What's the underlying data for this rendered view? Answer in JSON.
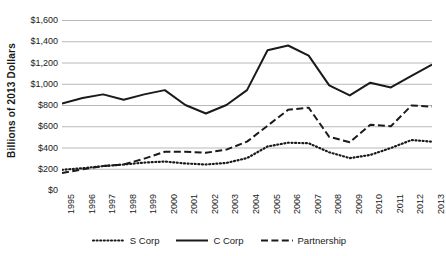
{
  "chart_data": {
    "type": "line",
    "title": "",
    "xlabel": "",
    "ylabel": "Billions of 2013 Dollars",
    "x": [
      1995,
      1996,
      1997,
      1998,
      1999,
      2000,
      2001,
      2002,
      2003,
      2004,
      2005,
      2006,
      2007,
      2008,
      2009,
      2010,
      2011,
      2012,
      2013
    ],
    "categories": [
      "1995",
      "1996",
      "1997",
      "1998",
      "1999",
      "2000",
      "2001",
      "2002",
      "2003",
      "2004",
      "2005",
      "2006",
      "2007",
      "2008",
      "2009",
      "2010",
      "2011",
      "2012",
      "2013"
    ],
    "ylim": [
      0,
      1600
    ],
    "ytick_values": [
      0,
      200,
      400,
      600,
      800,
      1000,
      1200,
      1400,
      1600
    ],
    "ytick_labels": [
      "$0",
      "$200",
      "$400",
      "$600",
      "$800",
      "$1,000",
      "$1,200",
      "$1,400",
      "$1,600"
    ],
    "grid": true,
    "legend_position": "bottom",
    "series": [
      {
        "name": "S Corp",
        "style": "dotted",
        "color": "#1a1a1a",
        "values": [
          190,
          205,
          225,
          240,
          258,
          268,
          250,
          240,
          255,
          300,
          410,
          445,
          440,
          355,
          300,
          330,
          395,
          470,
          455
        ]
      },
      {
        "name": "C Corp",
        "style": "solid",
        "color": "#1a1a1a",
        "values": [
          815,
          865,
          900,
          850,
          900,
          940,
          800,
          720,
          800,
          940,
          1315,
          1360,
          1265,
          985,
          890,
          1010,
          965,
          1075,
          1180
        ]
      },
      {
        "name": "Partnership",
        "style": "dashed",
        "color": "#1a1a1a",
        "values": [
          160,
          195,
          225,
          240,
          295,
          360,
          360,
          350,
          380,
          455,
          605,
          755,
          775,
          500,
          450,
          615,
          600,
          795,
          785
        ]
      }
    ]
  },
  "axis": {
    "y_title": "Billions of 2013 Dollars"
  },
  "legend": {
    "items": [
      {
        "label": "S Corp",
        "style": "dotted"
      },
      {
        "label": "C Corp",
        "style": "solid"
      },
      {
        "label": "Partnership",
        "style": "dashed"
      }
    ]
  },
  "colors": {
    "ink": "#1a1a1a",
    "gridline": "#b8b8b8",
    "background": "#ffffff"
  }
}
